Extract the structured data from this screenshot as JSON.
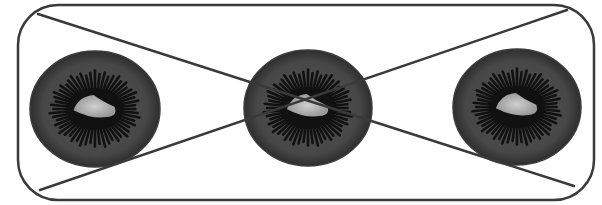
{
  "figure": {
    "colors": {
      "background": "#ffffff",
      "stroke": "#3a3a3a",
      "kiwi_flesh": "#4a4a4a",
      "kiwi_rim": "#3c3c3c",
      "kiwi_seeds": "#111111",
      "kiwi_core": "#b8b8b8"
    },
    "frame": {
      "x": 18,
      "y": 5,
      "width": 576,
      "height": 195,
      "radius": 40
    },
    "cross_lines": [
      {
        "name": "diagonal-top-left-to-bottom-right",
        "x1": 38,
        "y1": 14,
        "x2": 574,
        "y2": 186
      },
      {
        "name": "diagonal-bottom-left-to-top-right",
        "x1": 40,
        "y1": 190,
        "x2": 567,
        "y2": 10
      }
    ],
    "kiwis": [
      {
        "name": "kiwi-slice-left",
        "cx": 95,
        "cy": 109,
        "rx": 65,
        "ry": 58
      },
      {
        "name": "kiwi-slice-center",
        "cx": 308,
        "cy": 108,
        "rx": 64,
        "ry": 58
      },
      {
        "name": "kiwi-slice-right",
        "cx": 517,
        "cy": 107,
        "rx": 64,
        "ry": 58
      }
    ]
  }
}
